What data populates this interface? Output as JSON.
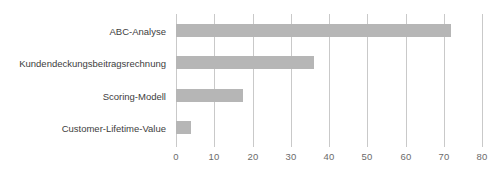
{
  "chart_data": {
    "type": "bar",
    "orientation": "horizontal",
    "title": "",
    "subtitle": "",
    "xlabel": "",
    "ylabel": "",
    "categories": [
      "ABC-Analyse",
      "Kundendeckungsbeitragsrechnung",
      "Scoring-Modell",
      "Customer-Lifetime-Value"
    ],
    "values": [
      72,
      36,
      17.5,
      4
    ],
    "series": [
      {
        "name": "",
        "values": [
          72,
          36,
          17.5,
          4
        ]
      }
    ],
    "xlim": [
      0,
      80
    ],
    "xticks": [
      0,
      10,
      20,
      30,
      40,
      50,
      60,
      70,
      80
    ],
    "xtick_labels": [
      "0",
      "10",
      "20",
      "30",
      "40",
      "50",
      "60",
      "70",
      "80"
    ],
    "grid": "vertical",
    "legend": "none",
    "bar_color": "#b6b6b6",
    "grid_color": "#c9c9c9",
    "label_color": "#3d3d3d",
    "tick_label_color": "#6b6b6b",
    "background": "#ffffff"
  }
}
